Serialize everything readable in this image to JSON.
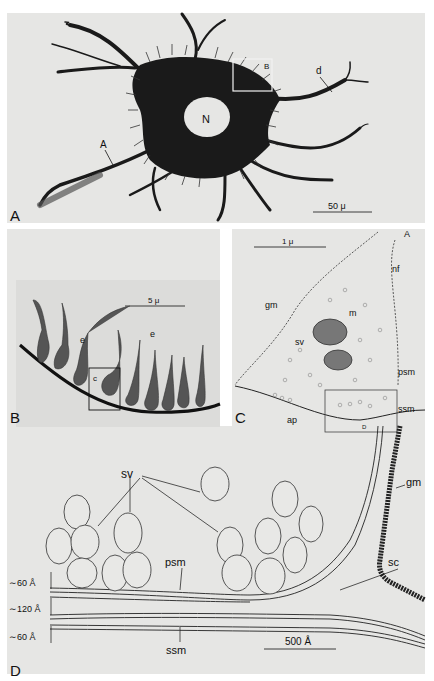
{
  "figure": {
    "panels": [
      {
        "id": "A",
        "letter": "A",
        "labels": {
          "nucleus": "N",
          "axon": "A",
          "dendrite": "d",
          "inset_box": "B"
        },
        "scale_bar": "50 μ"
      },
      {
        "id": "B",
        "letter": "B",
        "labels": {
          "endings_1": "e",
          "endings_2": "e",
          "inset_box": "c"
        },
        "scale_bar": "5 μ"
      },
      {
        "id": "C",
        "letter": "C",
        "labels": {
          "axon": "A",
          "neurofilaments": "nf",
          "glial_membrane": "gm",
          "mitochondria": "m",
          "synaptic_vesicles": "sv",
          "presynaptic_membrane": "psm",
          "subsynaptic_membrane": "ssm",
          "active_points": "ap",
          "inset_box": "D"
        },
        "scale_bar": "1 μ"
      },
      {
        "id": "D",
        "letter": "D",
        "labels": {
          "synaptic_vesicles": "sv",
          "glial_membrane": "gm",
          "presynaptic_membrane": "psm",
          "synaptic_cleft": "sc",
          "subsynaptic_membrane": "ssm"
        },
        "dimensions": [
          "∼60 Å",
          "∼120 Å",
          "∼60 Å"
        ],
        "scale_bar": "500 Å"
      }
    ]
  }
}
